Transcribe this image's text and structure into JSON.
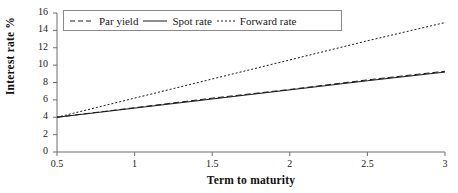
{
  "chart_data": {
    "type": "line",
    "title": "",
    "xlabel": "Term to maturity",
    "ylabel": "Interest rate %",
    "xlim": [
      0.5,
      3
    ],
    "ylim": [
      0,
      16
    ],
    "xticks": [
      "0.5",
      "1",
      "1.5",
      "2",
      "2.5",
      "3"
    ],
    "xtick_values": [
      0.5,
      1,
      1.5,
      2,
      2.5,
      3
    ],
    "yticks": [
      "0",
      "2",
      "4",
      "6",
      "8",
      "10",
      "12",
      "14",
      "16"
    ],
    "ytick_values": [
      0,
      2,
      4,
      6,
      8,
      10,
      12,
      14,
      16
    ],
    "grid": false,
    "legend_position": "top-left-inside",
    "x": [
      0.5,
      1.0,
      1.5,
      2.0,
      2.5,
      3.0
    ],
    "series": [
      {
        "name": "Par yield",
        "style": "dashed",
        "color": "#1a1a1a",
        "values": [
          4.0,
          5.1,
          6.2,
          7.2,
          8.3,
          9.3
        ]
      },
      {
        "name": "Spot rate",
        "style": "solid",
        "color": "#1a1a1a",
        "values": [
          4.0,
          5.05,
          6.1,
          7.15,
          8.2,
          9.2
        ]
      },
      {
        "name": "Forward rate",
        "style": "dotted",
        "color": "#1a1a1a",
        "values": [
          4.0,
          6.2,
          8.4,
          10.6,
          12.8,
          14.9
        ]
      }
    ]
  },
  "legend": {
    "items": [
      {
        "label": "Par yield",
        "sample": "dashed-line-sample"
      },
      {
        "label": "Spot rate",
        "sample": "solid-line-sample"
      },
      {
        "label": "Forward rate",
        "sample": "dotted-line-sample"
      }
    ]
  },
  "axes": {
    "x_title": "Term to maturity",
    "y_title": "Interest rate %"
  }
}
